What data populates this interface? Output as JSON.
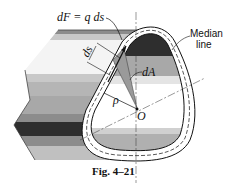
{
  "figure": {
    "caption": "Fig. 4–21",
    "labels": {
      "force": "dF = q ds",
      "ds": "ds",
      "area": "dA",
      "rho": "ρ",
      "origin": "O",
      "median_line_1": "Median",
      "median_line_2": "line"
    },
    "colors": {
      "outline": "#111111",
      "band_dark": "#2e2e2e",
      "band_mid": "#8c8c8c",
      "band_light": "#c8c8c8",
      "band_pale": "#e4e4e4",
      "wedge": "#9a9a9a"
    }
  }
}
